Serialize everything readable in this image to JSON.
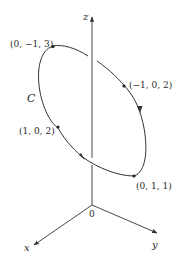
{
  "diagram": {
    "type": "3d-curve-on-axes",
    "axes": {
      "x": {
        "label": "x"
      },
      "y": {
        "label": "y"
      },
      "z": {
        "label": "z"
      },
      "origin": {
        "label": "0"
      }
    },
    "curve": {
      "label": "C",
      "shape": "ellipse",
      "orientation_arrows": 2
    },
    "points": [
      {
        "label": "(0, −1, 3)"
      },
      {
        "label": "(−1, 0, 2)"
      },
      {
        "label": "(0, 1, 1)"
      },
      {
        "label": "(1, 0, 2)"
      }
    ],
    "colors": {
      "line": "#333333",
      "background": "#ffffff"
    }
  }
}
